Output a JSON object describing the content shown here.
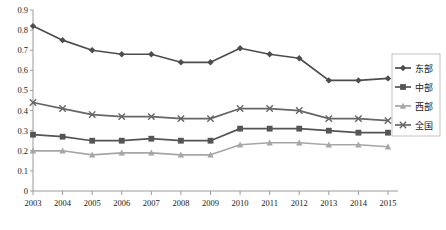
{
  "chart_data": {
    "type": "line",
    "title": "",
    "subtitle": "",
    "xlabel": "",
    "ylabel": "",
    "x": [
      2003,
      2004,
      2005,
      2006,
      2007,
      2008,
      2009,
      2010,
      2011,
      2012,
      2013,
      2014,
      2015
    ],
    "categories": [
      "2003",
      "2004",
      "2005",
      "2006",
      "2007",
      "2008",
      "2009",
      "2010",
      "2011",
      "2012",
      "2013",
      "2014",
      "2015"
    ],
    "xlim": [
      2003,
      2015
    ],
    "ylim": [
      0,
      0.9
    ],
    "ytick_labels": [
      "0",
      "0.1",
      "0.2",
      "0.3",
      "0.4",
      "0.5",
      "0.6",
      "0.7",
      "0.8",
      "0.9"
    ],
    "ytick_values": [
      0,
      0.1,
      0.2,
      0.3,
      0.4,
      0.5,
      0.6,
      0.7,
      0.8,
      0.9
    ],
    "grid": false,
    "legend_position": "right",
    "series": [
      {
        "name": "东部",
        "marker": "diamond",
        "color": "#4d4d4d",
        "values": [
          0.82,
          0.75,
          0.7,
          0.68,
          0.68,
          0.64,
          0.64,
          0.71,
          0.68,
          0.66,
          0.55,
          0.55,
          0.56
        ]
      },
      {
        "name": "中部",
        "marker": "square",
        "color": "#555555",
        "values": [
          0.28,
          0.27,
          0.25,
          0.25,
          0.26,
          0.25,
          0.25,
          0.31,
          0.31,
          0.31,
          0.3,
          0.29,
          0.29
        ]
      },
      {
        "name": "西部",
        "marker": "triangle",
        "color": "#a6a6a6",
        "values": [
          0.2,
          0.2,
          0.18,
          0.19,
          0.19,
          0.18,
          0.18,
          0.23,
          0.24,
          0.24,
          0.23,
          0.23,
          0.22
        ]
      },
      {
        "name": "全国",
        "marker": "x",
        "color": "#666666",
        "values": [
          0.44,
          0.41,
          0.38,
          0.37,
          0.37,
          0.36,
          0.36,
          0.41,
          0.41,
          0.4,
          0.36,
          0.36,
          0.35
        ]
      }
    ]
  },
  "legend": {
    "items": [
      {
        "label": "东部"
      },
      {
        "label": "中部"
      },
      {
        "label": "西部"
      },
      {
        "label": "全国"
      }
    ]
  }
}
